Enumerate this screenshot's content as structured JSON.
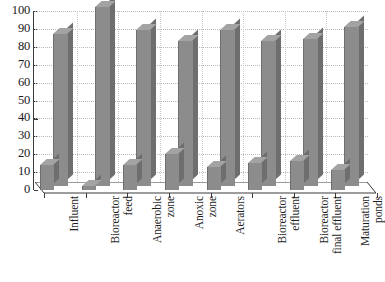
{
  "chart_data": {
    "type": "bar",
    "title": "",
    "subtitle": "",
    "xlabel": "",
    "ylabel": "",
    "ylim": [
      0,
      100
    ],
    "ytick_labels": [
      "0",
      "10",
      "20",
      "30",
      "40",
      "50",
      "60",
      "70",
      "80",
      "90",
      "100"
    ],
    "ytick_values": [
      0,
      10,
      20,
      30,
      40,
      50,
      60,
      70,
      80,
      90,
      100
    ],
    "grid": true,
    "legend": "none",
    "style": "3d-bar",
    "categories": [
      "Influent",
      "Bioreactor feed",
      "Anaerobic zone",
      "Anoxic zone",
      "Aerators",
      "Bioreactor effluent",
      "Bioreactor final effluent",
      "Maturation ponds"
    ],
    "category_label_lines": [
      [
        "Influent"
      ],
      [
        "Bioreactor",
        "feed"
      ],
      [
        "Anaerobic",
        "zone"
      ],
      [
        "Anoxic",
        "zone"
      ],
      [
        "Aerators"
      ],
      [
        "Bioreactor",
        "effluent"
      ],
      [
        "Bioreactor",
        "final effluent"
      ],
      [
        "Maturation",
        "ponds"
      ]
    ],
    "series": [
      {
        "name": "front",
        "values": [
          14,
          2,
          14,
          20,
          13,
          15,
          16,
          11
        ]
      },
      {
        "name": "back",
        "values": [
          85,
          100,
          87,
          81,
          87,
          81,
          82,
          89
        ]
      }
    ],
    "colors": {
      "bar_face": "#8c8c8c",
      "bar_side": "#6e6e6e",
      "bar_top": "#a3a3a3",
      "axis": "#3a3a3a",
      "grid": "#b9b9b9",
      "background": "#ffffff",
      "text": "#1a1a1a"
    }
  }
}
